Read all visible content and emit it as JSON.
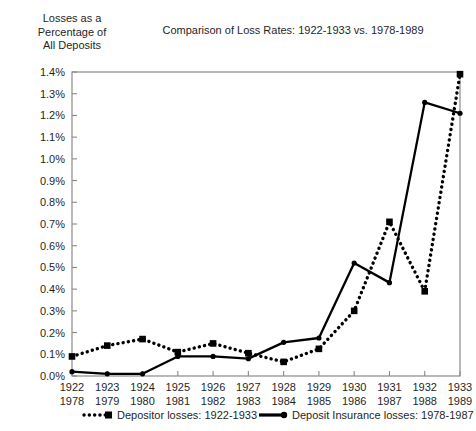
{
  "figure": {
    "y_axis_caption": "Losses as a\nPercentage of\nAll Deposits",
    "title": "Comparison of Loss Rates: 1922-1933 vs. 1978-1989"
  },
  "legend": {
    "series1_label": "Depositor losses: 1922-1933",
    "series2_label": "Deposit Insurance losses: 1978-1987"
  },
  "axis": {
    "y_ticks": [
      "0.0%",
      "0.1%",
      "0.2%",
      "0.3%",
      "0.4%",
      "0.5%",
      "0.6%",
      "0.7%",
      "0.8%",
      "0.9%",
      "1.0%",
      "1.1%",
      "1.2%",
      "1.3%",
      "1.4%"
    ],
    "x_ticks_top": [
      "1922",
      "1923",
      "1924",
      "1925",
      "1926",
      "1927",
      "1928",
      "1929",
      "1930",
      "1931",
      "1932",
      "1933"
    ],
    "x_ticks_bottom": [
      "1978",
      "1979",
      "1980",
      "1981",
      "1982",
      "1983",
      "1984",
      "1985",
      "1986",
      "1987",
      "1988",
      "1989"
    ]
  },
  "colors": {
    "line": "#000000",
    "axis": "#8a8a8a",
    "text": "#1f1f1f",
    "background": "#ffffff"
  },
  "chart_data": {
    "type": "line",
    "title": "Comparison of Loss Rates: 1922-1933 vs. 1978-1989",
    "xlabel": "",
    "ylabel": "Losses as a Percentage of All Deposits",
    "ylim": [
      0.0,
      1.4
    ],
    "ytick_step": 0.1,
    "grid": false,
    "legend_position": "below-axis",
    "categories": [
      "1922/1978",
      "1923/1979",
      "1924/1980",
      "1925/1981",
      "1926/1982",
      "1927/1983",
      "1928/1984",
      "1929/1985",
      "1930/1986",
      "1931/1987",
      "1932/1988",
      "1933/1989"
    ],
    "x_top": [
      "1922",
      "1923",
      "1924",
      "1925",
      "1926",
      "1927",
      "1928",
      "1929",
      "1930",
      "1931",
      "1932",
      "1933"
    ],
    "x_bottom": [
      "1978",
      "1979",
      "1980",
      "1981",
      "1982",
      "1983",
      "1984",
      "1985",
      "1986",
      "1987",
      "1988",
      "1989"
    ],
    "series": [
      {
        "name": "Depositor losses: 1922-1933",
        "style": "dotted",
        "marker": "square",
        "values": [
          0.09,
          0.14,
          0.17,
          0.11,
          0.15,
          0.105,
          0.065,
          0.125,
          0.3,
          0.71,
          0.39,
          1.39
        ]
      },
      {
        "name": "Deposit Insurance losses: 1978-1987",
        "style": "solid",
        "marker": "circle",
        "values": [
          0.02,
          0.01,
          0.01,
          0.09,
          0.09,
          0.08,
          0.155,
          0.175,
          0.52,
          0.43,
          1.26,
          1.21
        ]
      }
    ]
  }
}
